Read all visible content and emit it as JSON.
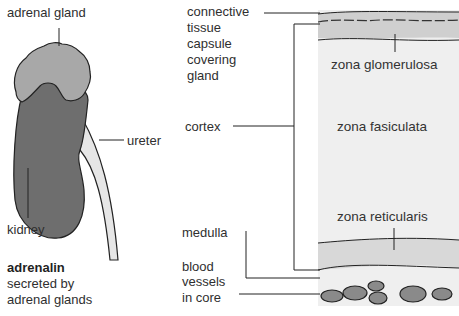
{
  "left_panel": {
    "labels": {
      "adrenal_gland": "adrenal gland",
      "ureter": "ureter",
      "kidney": "kidney"
    },
    "caption": {
      "title": "adrenalin",
      "line1": "secreted by",
      "line2": "adrenal glands"
    }
  },
  "right_panel": {
    "labels": {
      "capsule": [
        "connective",
        "tissue",
        "capsule",
        "covering",
        "gland"
      ],
      "cortex": "cortex",
      "medulla": "medulla",
      "blood_vessels": [
        "blood",
        "vessels",
        "in core"
      ]
    },
    "zones": {
      "glomerulosa": "zona glomerulosa",
      "fasiculata": "zona fasiculata",
      "reticularis": "zona reticularis"
    }
  },
  "colors": {
    "kidney": "#6e6e6e",
    "adrenal": "#a8a8a8",
    "ureter": "#e6e6e6",
    "cortex_bg": "#efefef",
    "capsule_band": "#cfcfcf",
    "medulla_band": "#d8d8d8",
    "vessel": "#8a8a8a"
  }
}
